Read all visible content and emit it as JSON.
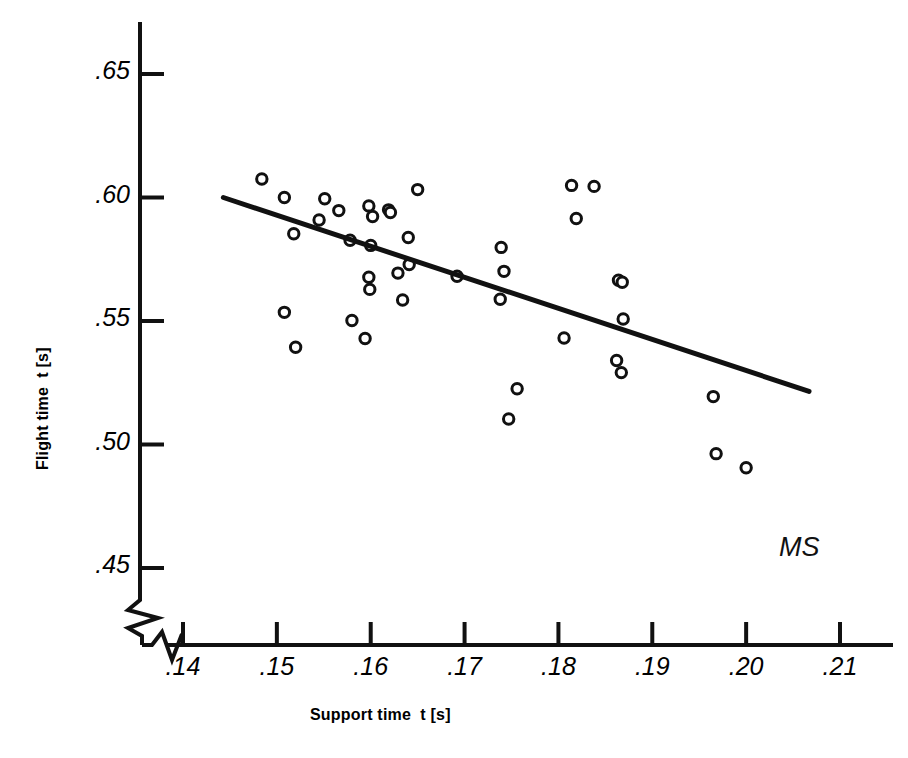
{
  "chart_data": {
    "type": "scatter",
    "title": "",
    "xlabel": "Support time  t [s]",
    "ylabel": "Flight time  t [s]",
    "xlim": [
      0.1355,
      0.2145
    ],
    "ylim": [
      0.4365,
      0.6605
    ],
    "xticks": [
      0.14,
      0.15,
      0.16,
      0.17,
      0.18,
      0.19,
      0.2,
      0.21
    ],
    "xtick_labels": [
      ".14",
      ".15",
      ".16",
      ".17",
      ".18",
      ".19",
      ".20",
      ".21"
    ],
    "yticks": [
      0.45,
      0.5,
      0.55,
      0.6,
      0.65
    ],
    "ytick_labels": [
      ".45",
      ".50",
      ".55",
      ".60",
      ".65"
    ],
    "grid": false,
    "legend": null,
    "axis_break_x": true,
    "axis_break_y": true,
    "annotations": [
      {
        "text": "MS",
        "x": 0.2035,
        "y": 0.4565
      }
    ],
    "series": [
      {
        "name": "observations",
        "type": "scatter",
        "marker": "open-circle",
        "points": [
          {
            "x": 0.1484,
            "y": 0.6075
          },
          {
            "x": 0.1508,
            "y": 0.6
          },
          {
            "x": 0.1551,
            "y": 0.5995
          },
          {
            "x": 0.1566,
            "y": 0.5947
          },
          {
            "x": 0.1545,
            "y": 0.5909
          },
          {
            "x": 0.1598,
            "y": 0.5966
          },
          {
            "x": 0.1602,
            "y": 0.5923
          },
          {
            "x": 0.1619,
            "y": 0.595
          },
          {
            "x": 0.1621,
            "y": 0.5939
          },
          {
            "x": 0.1578,
            "y": 0.5827
          },
          {
            "x": 0.16,
            "y": 0.5806
          },
          {
            "x": 0.1518,
            "y": 0.5853
          },
          {
            "x": 0.164,
            "y": 0.5838
          },
          {
            "x": 0.165,
            "y": 0.6032
          },
          {
            "x": 0.1641,
            "y": 0.5729
          },
          {
            "x": 0.1692,
            "y": 0.5681
          },
          {
            "x": 0.1598,
            "y": 0.5677
          },
          {
            "x": 0.1599,
            "y": 0.5628
          },
          {
            "x": 0.1739,
            "y": 0.5798
          },
          {
            "x": 0.1814,
            "y": 0.6049
          },
          {
            "x": 0.1838,
            "y": 0.6045
          },
          {
            "x": 0.1819,
            "y": 0.5915
          },
          {
            "x": 0.1742,
            "y": 0.5701
          },
          {
            "x": 0.1864,
            "y": 0.5665
          },
          {
            "x": 0.1868,
            "y": 0.5657
          },
          {
            "x": 0.1738,
            "y": 0.5588
          },
          {
            "x": 0.1869,
            "y": 0.5508
          },
          {
            "x": 0.1806,
            "y": 0.5431
          },
          {
            "x": 0.1862,
            "y": 0.534
          },
          {
            "x": 0.1867,
            "y": 0.5291
          },
          {
            "x": 0.1965,
            "y": 0.5194
          },
          {
            "x": 0.1968,
            "y": 0.4963
          },
          {
            "x": 0.2,
            "y": 0.4906
          },
          {
            "x": 0.1508,
            "y": 0.5535
          },
          {
            "x": 0.152,
            "y": 0.5394
          },
          {
            "x": 0.158,
            "y": 0.5502
          },
          {
            "x": 0.1594,
            "y": 0.5429
          },
          {
            "x": 0.1634,
            "y": 0.5585
          },
          {
            "x": 0.1629,
            "y": 0.5694
          },
          {
            "x": 0.1756,
            "y": 0.5226
          },
          {
            "x": 0.1747,
            "y": 0.5103
          }
        ]
      },
      {
        "name": "regression-line",
        "type": "line",
        "x0": 0.1443,
        "y0": 0.6,
        "x1": 0.2067,
        "y1": 0.5215
      }
    ]
  },
  "figure": {
    "ylabel": "Flight time  t [s]",
    "xlabel": "Support time  t [s]",
    "annotation_ms": "MS"
  }
}
